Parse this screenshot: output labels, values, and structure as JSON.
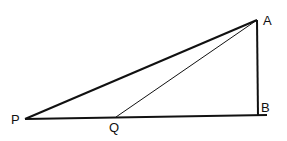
{
  "diagram": {
    "type": "geometry-triangle",
    "colors": {
      "stroke": "#111111",
      "background": "#ffffff"
    },
    "points": {
      "A": {
        "label": "A",
        "x": 257,
        "y": 20,
        "lx": 263,
        "ly": 25
      },
      "B": {
        "label": "B",
        "x": 257,
        "y": 116,
        "lx": 261,
        "ly": 112
      },
      "P": {
        "label": "P",
        "x": 25,
        "y": 119,
        "lx": 11,
        "ly": 124
      },
      "Q": {
        "label": "Q",
        "x": 116,
        "y": 117,
        "lx": 109,
        "ly": 132
      }
    },
    "segments": [
      {
        "from": "P",
        "to": "A",
        "weight": "thick"
      },
      {
        "from": "P",
        "to": "B",
        "weight": "thick"
      },
      {
        "from": "A",
        "to": "B",
        "weight": "thick"
      },
      {
        "from": "Q",
        "to": "A",
        "weight": "thin"
      }
    ]
  }
}
